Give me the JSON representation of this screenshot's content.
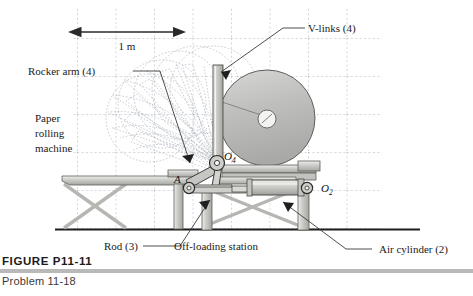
{
  "figure": {
    "title": "FIGURE P11-11",
    "subtitle": "Problem 11-18"
  },
  "callouts": {
    "v_links": "V-links (4)",
    "rocker_arm": "Rocker arm (4)",
    "paper_machine_line1": "Paper",
    "paper_machine_line2": "rolling",
    "paper_machine_line3": "machine",
    "rod": "Rod (3)",
    "offloading": "Off-loading station",
    "air_cylinder": "Air cylinder (2)"
  },
  "dimension": {
    "label": "1 m"
  },
  "joints": {
    "o4": "O",
    "o4_sub": "4",
    "a": "A",
    "o2": "O",
    "o2_sub": "2"
  },
  "colors": {
    "ink": "#1a1a1a",
    "grid": "#9aa3ad",
    "metal_light": "#e3e3e1",
    "metal_mid": "#c9c9c6",
    "metal_dark": "#a8a8a4",
    "roll_fill": "#bdbdbd",
    "ghost": "#b9bec6",
    "rule": "#b9b9b9"
  }
}
